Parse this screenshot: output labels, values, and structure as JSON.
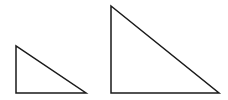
{
  "diagram": {
    "stroke_color": "#1a1a1a",
    "background": "#ffffff",
    "shapes": [
      {
        "name": "small-right-triangle",
        "type": "right-triangle",
        "points": [
          [
            16,
            46
          ],
          [
            16,
            93
          ],
          [
            86,
            93
          ]
        ]
      },
      {
        "name": "large-right-triangle",
        "type": "right-triangle",
        "points": [
          [
            111,
            6
          ],
          [
            111,
            93
          ],
          [
            219,
            93
          ]
        ]
      }
    ]
  }
}
